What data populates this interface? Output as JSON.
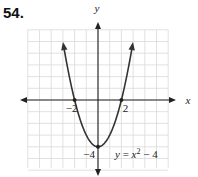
{
  "problem_number": "54.",
  "chart_data": {
    "type": "line",
    "title": "",
    "function": "y = x^2 - 4",
    "equation_label": "y = x² − 4",
    "xlabel": "x",
    "ylabel": "y",
    "xlim": [
      -6,
      6
    ],
    "ylim": [
      -6,
      6
    ],
    "grid": true,
    "grid_step": 1,
    "tick_labels": {
      "x": [
        {
          "value": -2,
          "label": "−2"
        },
        {
          "value": 2,
          "label": "2"
        }
      ],
      "y": [
        {
          "value": -4,
          "label": "−4"
        }
      ]
    },
    "x": [
      -3,
      -2.5,
      -2,
      -1.5,
      -1,
      -0.5,
      0,
      0.5,
      1,
      1.5,
      2,
      2.5,
      3
    ],
    "y": [
      5,
      2.25,
      0,
      -1.75,
      -3,
      -3.75,
      -4,
      -3.75,
      -3,
      -1.75,
      0,
      2.25,
      5
    ],
    "marked_points": [
      [
        -2,
        0
      ],
      [
        2,
        0
      ],
      [
        0,
        -4
      ]
    ],
    "arrows_on_curve_ends": true,
    "colors": {
      "curve": "#333333",
      "grid": "#d9d9d9",
      "axis": "#222222"
    }
  }
}
